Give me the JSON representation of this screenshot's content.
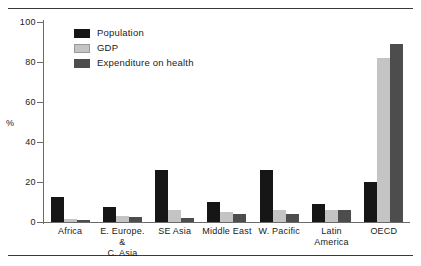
{
  "chart_data": {
    "type": "bar",
    "title": "",
    "xlabel": "",
    "ylabel": "%",
    "ylim": [
      0,
      100
    ],
    "yticks": [
      0,
      20,
      40,
      60,
      80,
      100
    ],
    "grid": false,
    "legend_position": "top-left",
    "categories": [
      "Africa",
      "E. Europe. & C. Asia",
      "SE Asia",
      "Middle East",
      "W. Pacific",
      "Latin America",
      "OECD"
    ],
    "category_lines": [
      [
        "Africa"
      ],
      [
        "E. Europe. &",
        "C. Asia"
      ],
      [
        "SE Asia"
      ],
      [
        "Middle East"
      ],
      [
        "W. Pacific"
      ],
      [
        "Latin",
        "America"
      ],
      [
        "OECD"
      ]
    ],
    "series": [
      {
        "name": "Population",
        "color": "#161616",
        "values": [
          12.5,
          7.5,
          26,
          10,
          26,
          9,
          20
        ]
      },
      {
        "name": "GDP",
        "color": "#c4c4c4",
        "values": [
          1.5,
          3,
          6,
          5,
          6,
          6,
          82
        ]
      },
      {
        "name": "Expenditure on health",
        "color": "#4d4d4d",
        "values": [
          1,
          2.5,
          2,
          4,
          4,
          6,
          89
        ]
      }
    ]
  },
  "axis": {
    "y_title": "%",
    "tick_labels": [
      "100",
      "80",
      "60",
      "40",
      "20",
      "0"
    ]
  },
  "legend": {
    "items": [
      {
        "label": "Population",
        "key": "population"
      },
      {
        "label": "GDP",
        "key": "gdp"
      },
      {
        "label": "Expenditure on health",
        "key": "health"
      }
    ]
  }
}
